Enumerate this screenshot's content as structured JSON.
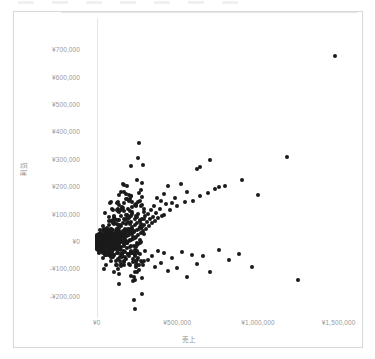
{
  "chart_data": {
    "type": "scatter",
    "title": "",
    "xlabel": "売上",
    "ylabel": "利益",
    "currency_symbol": "¥",
    "grid": false,
    "legend": "none",
    "xlim": [
      -60000,
      1620000
    ],
    "ylim": [
      -260000,
      760000
    ],
    "xticks": [
      0,
      500000,
      1000000,
      1500000
    ],
    "xticklabels": [
      "¥0",
      "¥500,000",
      "¥1,000,000",
      "¥1,500,000"
    ],
    "yticks": [
      700000,
      600000,
      500000,
      400000,
      300000,
      200000,
      100000,
      0,
      -100000,
      -200000
    ],
    "yticklabels": [
      "¥700,000",
      "¥600,000",
      "¥500,000",
      "¥400,000",
      "¥300,000",
      "¥200,000",
      "¥100,000",
      "¥0",
      "-¥100,000",
      "-¥200,000"
    ],
    "marker_color": "#1a1a1a",
    "marker_size": 4,
    "series": [
      {
        "name": "売上対利益",
        "points": [
          [
            1480000,
            680000
          ],
          [
            1180000,
            310000
          ],
          [
            700000,
            300000
          ],
          [
            640000,
            275000
          ],
          [
            620000,
            268000
          ],
          [
            900000,
            225000
          ],
          [
            1000000,
            172000
          ],
          [
            795000,
            205000
          ],
          [
            760000,
            200000
          ],
          [
            735000,
            195000
          ],
          [
            690000,
            180000
          ],
          [
            640000,
            168000
          ],
          [
            600000,
            150000
          ],
          [
            558000,
            182000
          ],
          [
            545000,
            145000
          ],
          [
            520000,
            210000
          ],
          [
            500000,
            130000
          ],
          [
            485000,
            160000
          ],
          [
            470000,
            142000
          ],
          [
            455000,
            118000
          ],
          [
            445000,
            205000
          ],
          [
            430000,
            138000
          ],
          [
            420000,
            100000
          ],
          [
            415000,
            175000
          ],
          [
            405000,
            95000
          ],
          [
            398000,
            148000
          ],
          [
            390000,
            120000
          ],
          [
            382000,
            88000
          ],
          [
            375000,
            160000
          ],
          [
            368000,
            105000
          ],
          [
            360000,
            78000
          ],
          [
            355000,
            132000
          ],
          [
            348000,
            92000
          ],
          [
            340000,
            68000
          ],
          [
            335000,
            118000
          ],
          [
            330000,
            82000
          ],
          [
            322000,
            58000
          ],
          [
            318000,
            102000
          ],
          [
            312000,
            72000
          ],
          [
            305000,
            48000
          ],
          [
            300000,
            95000
          ],
          [
            295000,
            62000
          ],
          [
            288000,
            40000
          ],
          [
            282000,
            85000
          ],
          [
            278000,
            55000
          ],
          [
            272000,
            32000
          ],
          [
            268000,
            78000
          ],
          [
            262000,
            48000
          ],
          [
            258000,
            25000
          ],
          [
            252000,
            70000
          ],
          [
            248000,
            42000
          ],
          [
            242000,
            18000
          ],
          [
            238000,
            62000
          ],
          [
            232000,
            36000
          ],
          [
            228000,
            12000
          ],
          [
            222000,
            55000
          ],
          [
            218000,
            30000
          ],
          [
            212000,
            8000
          ],
          [
            208000,
            48000
          ],
          [
            202000,
            26000
          ],
          [
            198000,
            4000
          ],
          [
            192000,
            42000
          ],
          [
            188000,
            22000
          ],
          [
            182000,
            2000
          ],
          [
            178000,
            38000
          ],
          [
            172000,
            18000
          ],
          [
            168000,
            0
          ],
          [
            162000,
            34000
          ],
          [
            158000,
            15000
          ],
          [
            152000,
            -2000
          ],
          [
            148000,
            30000
          ],
          [
            142000,
            12000
          ],
          [
            138000,
            -4000
          ],
          [
            132000,
            26000
          ],
          [
            128000,
            10000
          ],
          [
            122000,
            -6000
          ],
          [
            118000,
            22000
          ],
          [
            112000,
            8000
          ],
          [
            108000,
            -8000
          ],
          [
            102000,
            20000
          ],
          [
            98000,
            6000
          ],
          [
            92000,
            -9000
          ],
          [
            88000,
            18000
          ],
          [
            82000,
            5000
          ],
          [
            78000,
            -10000
          ],
          [
            72000,
            16000
          ],
          [
            68000,
            4000
          ],
          [
            62000,
            -11000
          ],
          [
            58000,
            14000
          ],
          [
            52000,
            3000
          ],
          [
            48000,
            -12000
          ],
          [
            42000,
            12000
          ],
          [
            38000,
            2000
          ],
          [
            34000,
            -13000
          ],
          [
            30000,
            10000
          ],
          [
            26000,
            1000
          ],
          [
            22000,
            -14000
          ],
          [
            18000,
            8000
          ],
          [
            15000,
            0
          ],
          [
            12000,
            -8000
          ],
          [
            10000,
            6000
          ],
          [
            8000,
            -2000
          ],
          [
            6000,
            4000
          ],
          [
            5000,
            -4000
          ],
          [
            4000,
            2000
          ],
          [
            3000,
            -1000
          ],
          [
            2000,
            3000
          ],
          [
            1500,
            -3000
          ],
          [
            1000,
            1000
          ],
          [
            800,
            -2000
          ],
          [
            600,
            2000
          ],
          [
            400,
            0
          ],
          [
            200,
            -1000
          ],
          [
            100,
            1000
          ],
          [
            1250000,
            -140000
          ],
          [
            960000,
            -90000
          ],
          [
            880000,
            -45000
          ],
          [
            820000,
            -65000
          ],
          [
            760000,
            -30000
          ],
          [
            700000,
            -110000
          ],
          [
            660000,
            -52000
          ],
          [
            620000,
            -80000
          ],
          [
            590000,
            -48000
          ],
          [
            560000,
            -128000
          ],
          [
            530000,
            -38000
          ],
          [
            500000,
            -95000
          ],
          [
            470000,
            -60000
          ],
          [
            440000,
            -105000
          ],
          [
            420000,
            -42000
          ],
          [
            400000,
            -78000
          ],
          [
            380000,
            -35000
          ],
          [
            360000,
            -92000
          ],
          [
            340000,
            -50000
          ],
          [
            320000,
            -68000
          ],
          [
            300000,
            -32000
          ],
          [
            285000,
            -85000
          ],
          [
            270000,
            -45000
          ],
          [
            255000,
            -58000
          ],
          [
            240000,
            -28000
          ],
          [
            228000,
            -72000
          ],
          [
            215000,
            -40000
          ],
          [
            202000,
            -52000
          ],
          [
            190000,
            -24000
          ],
          [
            180000,
            -62000
          ],
          [
            170000,
            -35000
          ],
          [
            160000,
            -46000
          ],
          [
            150000,
            -20000
          ],
          [
            142000,
            -55000
          ],
          [
            134000,
            -30000
          ],
          [
            126000,
            -40000
          ],
          [
            118000,
            -18000
          ],
          [
            110000,
            -48000
          ],
          [
            102000,
            -26000
          ],
          [
            95000,
            -36000
          ],
          [
            88000,
            -15000
          ],
          [
            82000,
            -42000
          ],
          [
            75000,
            -22000
          ],
          [
            68000,
            -32000
          ],
          [
            62000,
            -13000
          ],
          [
            56000,
            -38000
          ],
          [
            50000,
            -19000
          ],
          [
            44000,
            -28000
          ],
          [
            38000,
            -11000
          ],
          [
            33000,
            -33000
          ],
          [
            28000,
            -17000
          ],
          [
            24000,
            -25000
          ],
          [
            20000,
            -9000
          ],
          [
            16000,
            -29000
          ],
          [
            13000,
            -15000
          ],
          [
            10000,
            -22000
          ],
          [
            7000,
            -7000
          ],
          [
            5000,
            -26000
          ],
          [
            3500,
            -13000
          ],
          [
            2500,
            -19000
          ],
          [
            1800,
            -6000
          ],
          [
            1200,
            -16000
          ],
          [
            700,
            -11000
          ],
          [
            300,
            -5000
          ]
        ]
      }
    ]
  },
  "axes": {
    "y_title": "利益",
    "x_title": "売上"
  }
}
